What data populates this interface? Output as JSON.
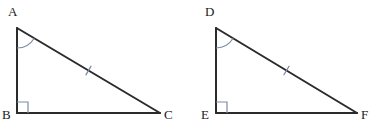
{
  "figure": {
    "background_color": "#ffffff",
    "width": 391,
    "height": 140,
    "stroke_color": "#2b2b2b",
    "mark_color": "#7a8ba8",
    "label_color": "#1a1a1a"
  },
  "triangles": [
    {
      "name": "triangle-abc",
      "vertices": {
        "top": {
          "label": "A",
          "x": 17,
          "y": 28,
          "label_x": 8,
          "label_y": 5
        },
        "right_angle": {
          "label": "B",
          "x": 17,
          "y": 113,
          "label_x": 2,
          "label_y": 108
        },
        "far": {
          "label": "C",
          "x": 160,
          "y": 113,
          "label_x": 164,
          "label_y": 108
        }
      },
      "angle_arc": {
        "at": "A",
        "radius": 20
      },
      "right_angle_mark": {
        "at": "B",
        "size": 11
      },
      "hypotenuse_ticks": 1
    },
    {
      "name": "triangle-def",
      "vertices": {
        "top": {
          "label": "D",
          "x": 216,
          "y": 28,
          "label_x": 205,
          "label_y": 5
        },
        "right_angle": {
          "label": "E",
          "x": 216,
          "y": 113,
          "label_x": 201,
          "label_y": 108
        },
        "far": {
          "label": "F",
          "x": 357,
          "y": 113,
          "label_x": 361,
          "label_y": 108
        }
      },
      "angle_arc": {
        "at": "D",
        "radius": 20
      },
      "right_angle_mark": {
        "at": "E",
        "size": 11
      },
      "hypotenuse_ticks": 1
    }
  ]
}
